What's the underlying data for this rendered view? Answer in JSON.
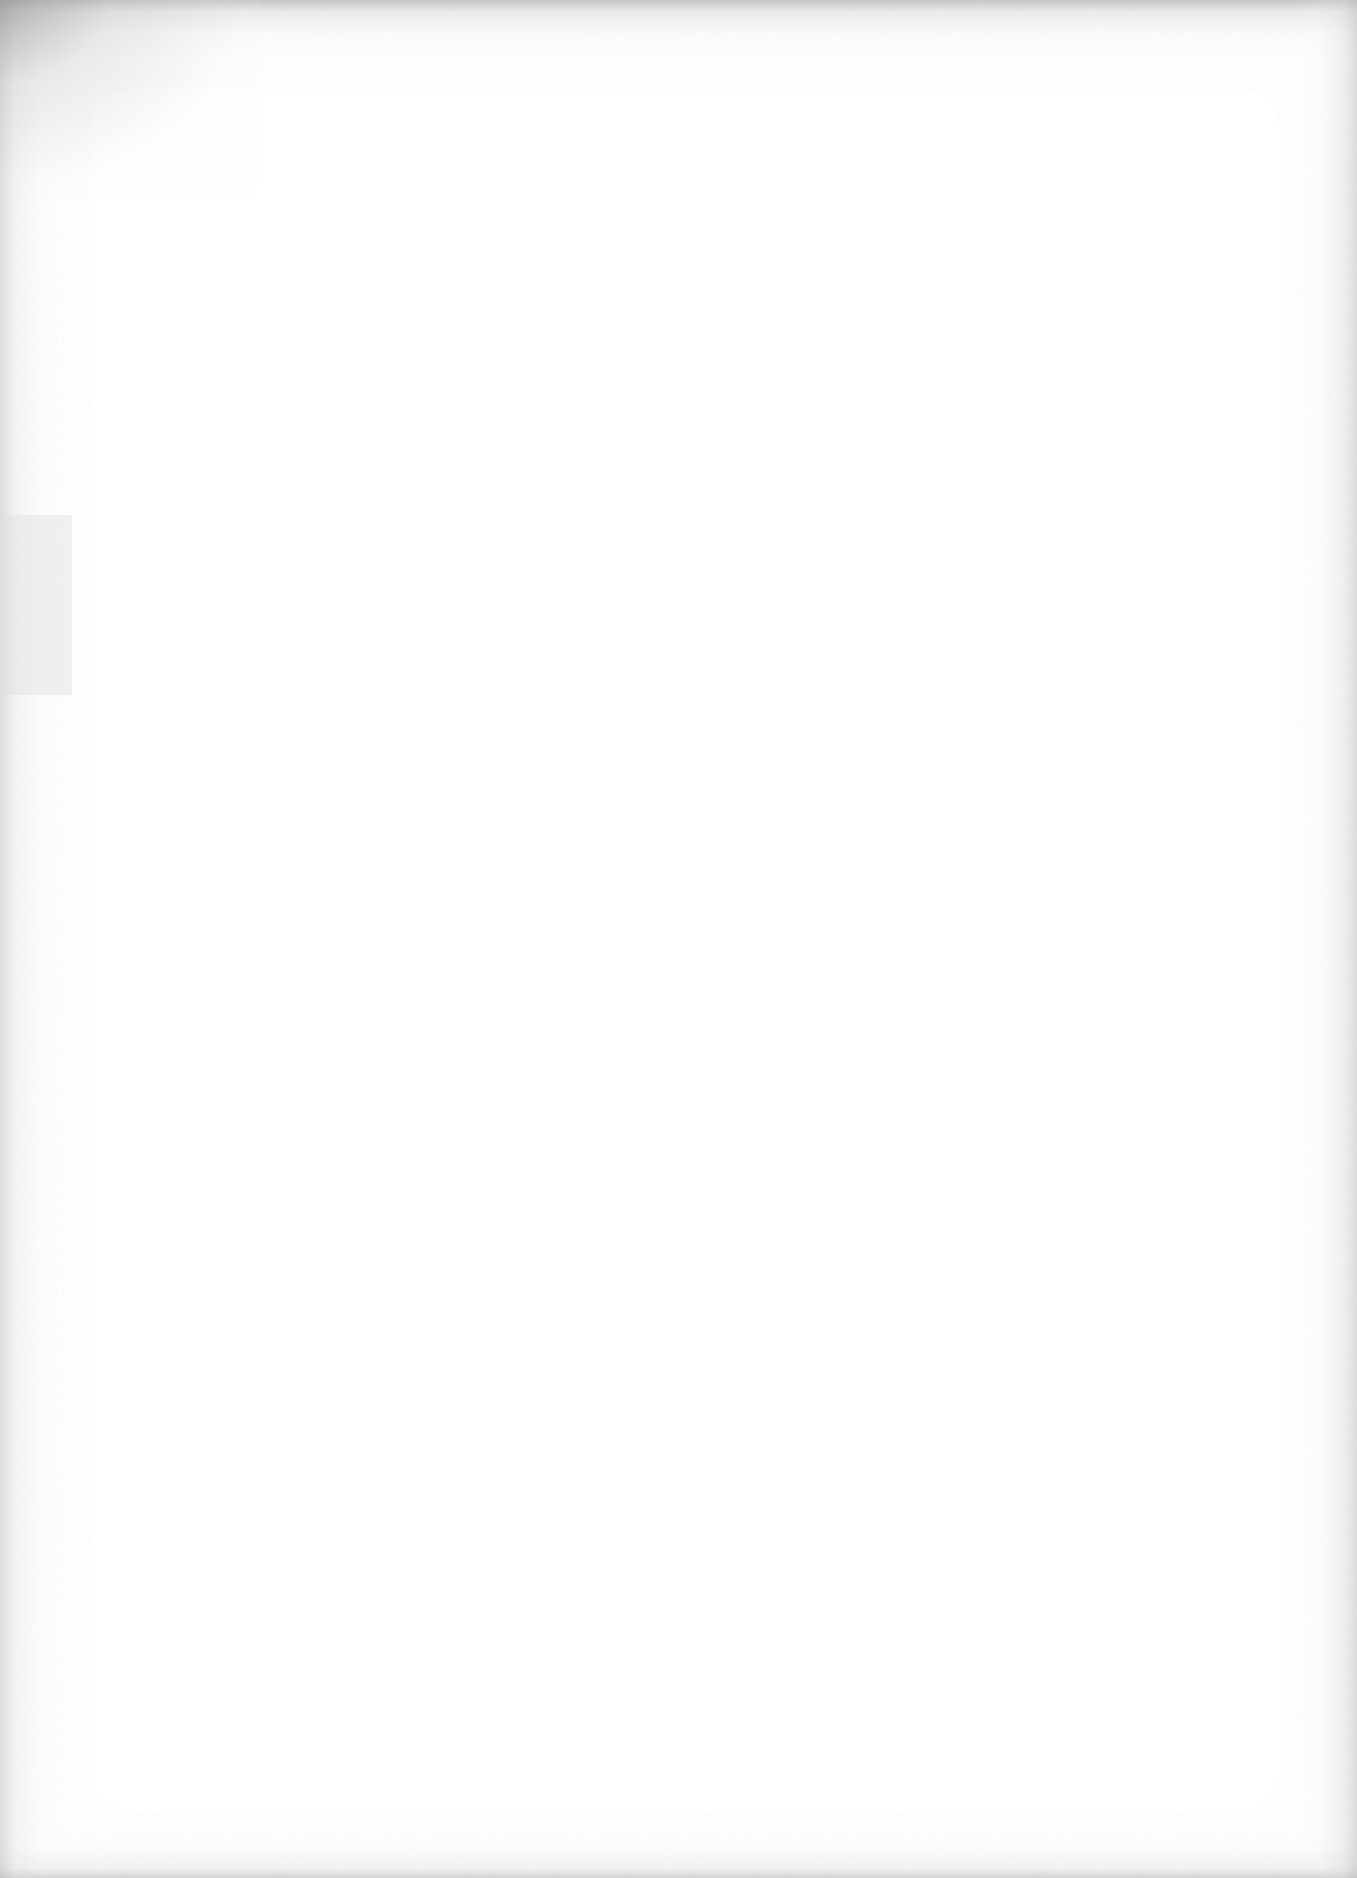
{
  "document": {
    "type": "scanned-page",
    "content": "",
    "background_color": "#ffffff",
    "edge_shadow_color": "#9a9a9a"
  }
}
